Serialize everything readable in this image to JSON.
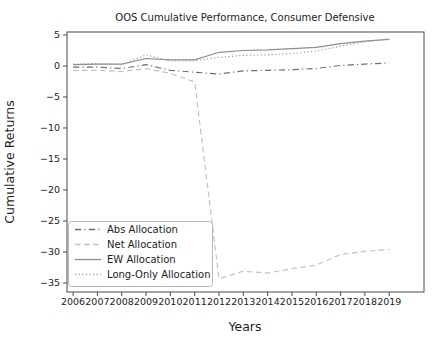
{
  "chart_data": {
    "type": "line",
    "title": "OOS Cumulative Performance, Consumer Defensive",
    "xlabel": "Years",
    "ylabel": "Cumulative Returns",
    "grid": false,
    "legend_position": "lower-left",
    "x": [
      2006,
      2007,
      2008,
      2009,
      2010,
      2011,
      2012,
      2013,
      2014,
      2015,
      2016,
      2017,
      2018,
      2019
    ],
    "x_tick_labels": [
      "2006",
      "2007",
      "2008",
      "2009",
      "2010",
      "2011",
      "2012",
      "2013",
      "2014",
      "2015",
      "2016",
      "2017",
      "2018",
      "2019"
    ],
    "y_ticks": [
      5,
      0,
      -5,
      -10,
      -15,
      -20,
      -25,
      -30,
      -35
    ],
    "xlim": [
      2005.75,
      2020.43
    ],
    "ylim": [
      -36.45,
      5.48
    ],
    "series": [
      {
        "name": "Abs Allocation",
        "style": "dashdot",
        "color": "#6e6e6e",
        "values": [
          -0.2,
          -0.2,
          -0.4,
          0.2,
          -0.7,
          -1.0,
          -1.3,
          -0.8,
          -0.7,
          -0.6,
          -0.4,
          0.1,
          0.3,
          0.5
        ]
      },
      {
        "name": "Net Allocation",
        "style": "dashed",
        "color": "#c2c2c2",
        "values": [
          -0.7,
          -0.7,
          -0.9,
          -0.4,
          -1.2,
          -2.6,
          -34.3,
          -33.1,
          -33.4,
          -32.7,
          -32.1,
          -30.4,
          -29.9,
          -29.6
        ]
      },
      {
        "name": "EW Allocation",
        "style": "solid",
        "color": "#8d8d8d",
        "values": [
          0.2,
          0.3,
          0.3,
          1.2,
          1.0,
          1.0,
          2.2,
          2.5,
          2.6,
          2.8,
          3.0,
          3.6,
          4.0,
          4.3
        ]
      },
      {
        "name": "Long-Only Allocation",
        "style": "dotted",
        "color": "#9d9d9d",
        "values": [
          0.3,
          0.4,
          0.2,
          1.8,
          0.8,
          0.8,
          1.4,
          1.7,
          1.8,
          2.0,
          2.4,
          3.2,
          3.9,
          4.4
        ]
      }
    ]
  }
}
